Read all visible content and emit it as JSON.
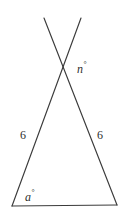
{
  "figure": {
    "background_color": "#ffffff",
    "stroke_color": "#3b3b3b",
    "text_color": "#2e2e2e",
    "labels": {
      "apex_angle": {
        "variable": "n",
        "degree_symbol": "°"
      },
      "base_angle": {
        "variable": "a",
        "degree_symbol": "°"
      },
      "left_side": "6",
      "right_side": "6"
    },
    "geometry": {
      "apex": [
        63,
        68
      ],
      "base_left": [
        12,
        206
      ],
      "base_right": [
        117,
        205
      ],
      "ray_upper_right_end": [
        81,
        18
      ],
      "ray_upper_left_end": [
        44,
        18
      ],
      "segments": [
        {
          "name": "left-leg-and-ray",
          "from": [
            44,
            18
          ],
          "to": [
            117,
            205
          ]
        },
        {
          "name": "right-leg-and-ray",
          "from": [
            81,
            18
          ],
          "to": [
            12,
            206
          ]
        },
        {
          "name": "base",
          "from": [
            12,
            206
          ],
          "to": [
            117,
            205
          ]
        }
      ]
    }
  }
}
